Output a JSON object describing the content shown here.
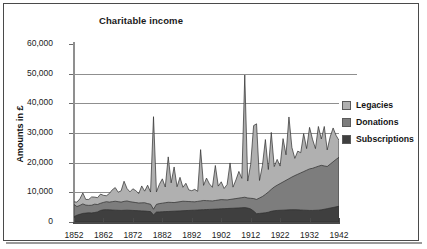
{
  "chart": {
    "title": "Charitable income",
    "ylabel": "Amounts in £"
  },
  "axes": {
    "y_ticks": [
      "0",
      "10,000",
      "20,000",
      "30,000",
      "40,000",
      "50,000",
      "60,000"
    ],
    "x_ticks": [
      "1852",
      "1862",
      "1872",
      "1882",
      "1892",
      "1902",
      "1912",
      "1922",
      "1932",
      "1942"
    ]
  },
  "legend": {
    "items": [
      {
        "label": "Legacies",
        "color": "#b0b0b0"
      },
      {
        "label": "Donations",
        "color": "#7d7d7d"
      },
      {
        "label": "Subscriptions",
        "color": "#3f3f3f"
      }
    ]
  },
  "chart_data": {
    "type": "area",
    "stacked": true,
    "title": "Charitable income",
    "xlabel": "",
    "ylabel": "Amounts in £",
    "xlim": [
      1852,
      1942
    ],
    "ylim": [
      0,
      60000
    ],
    "grid": true,
    "legend_position": "right",
    "x": [
      1852,
      1853,
      1854,
      1855,
      1856,
      1857,
      1858,
      1859,
      1860,
      1861,
      1862,
      1863,
      1864,
      1865,
      1866,
      1867,
      1868,
      1869,
      1870,
      1871,
      1872,
      1873,
      1874,
      1875,
      1876,
      1877,
      1878,
      1879,
      1880,
      1881,
      1882,
      1883,
      1884,
      1885,
      1886,
      1887,
      1888,
      1889,
      1890,
      1891,
      1892,
      1893,
      1894,
      1895,
      1896,
      1897,
      1898,
      1899,
      1900,
      1901,
      1902,
      1903,
      1904,
      1905,
      1906,
      1907,
      1908,
      1909,
      1910,
      1911,
      1912,
      1913,
      1914,
      1915,
      1916,
      1917,
      1918,
      1919,
      1920,
      1921,
      1922,
      1923,
      1924,
      1925,
      1926,
      1927,
      1928,
      1929,
      1930,
      1931,
      1932,
      1933,
      1934,
      1935,
      1936,
      1937,
      1938,
      1939,
      1940,
      1941,
      1942
    ],
    "series": [
      {
        "name": "Subscriptions",
        "color": "#3f3f3f",
        "values": [
          1800,
          2300,
          2600,
          2900,
          3000,
          3100,
          3050,
          3200,
          3400,
          3900,
          4100,
          4150,
          4100,
          4050,
          4000,
          3950,
          3900,
          3950,
          4000,
          3950,
          3900,
          3850,
          3800,
          3750,
          3700,
          3600,
          3500,
          2400,
          3350,
          3400,
          3450,
          3500,
          3550,
          3600,
          3650,
          3700,
          3750,
          3800,
          3850,
          3900,
          3950,
          4000,
          4050,
          4100,
          4150,
          4200,
          4250,
          4300,
          4350,
          4400,
          4450,
          4500,
          4550,
          4600,
          4650,
          4700,
          4750,
          4800,
          4850,
          4700,
          4400,
          3700,
          2800,
          2900,
          3000,
          3100,
          3300,
          3600,
          3800,
          3900,
          3950,
          4000,
          4050,
          4100,
          4150,
          4150,
          4100,
          4050,
          4000,
          3950,
          3900,
          3900,
          3950,
          4000,
          4100,
          4300,
          4500,
          4700,
          4900,
          5100,
          5300
        ]
      },
      {
        "name": "Donations",
        "color": "#7d7d7d",
        "values": [
          4100,
          2900,
          3000,
          3200,
          2700,
          2500,
          2600,
          2800,
          2500,
          2400,
          2500,
          2700,
          2600,
          2800,
          3000,
          2900,
          2800,
          3000,
          3100,
          2900,
          2800,
          2700,
          2600,
          2700,
          2800,
          2600,
          2500,
          1900,
          2600,
          2800,
          2900,
          3000,
          3100,
          3000,
          2900,
          3000,
          3100,
          3200,
          3100,
          3000,
          2900,
          2800,
          2900,
          3000,
          3100,
          3000,
          2900,
          2800,
          2900,
          3000,
          3100,
          3000,
          2900,
          3000,
          3100,
          3200,
          3300,
          3400,
          3500,
          3400,
          3600,
          4200,
          4800,
          5200,
          5600,
          6200,
          6800,
          7400,
          8000,
          8500,
          9000,
          9500,
          10000,
          10500,
          11000,
          11500,
          12000,
          12500,
          13000,
          13500,
          14000,
          14200,
          14500,
          14800,
          15000,
          14600,
          14200,
          14800,
          15400,
          16000,
          16500
        ]
      },
      {
        "name": "Legacies",
        "color": "#b0b0b0",
        "values": [
          900,
          1500,
          2200,
          3700,
          1900,
          2000,
          2800,
          2400,
          2300,
          3100,
          2400,
          2000,
          2900,
          4000,
          4600,
          3200,
          3800,
          6800,
          4200,
          3300,
          4500,
          4000,
          3200,
          5700,
          3900,
          6200,
          4100,
          31200,
          4200,
          6500,
          8200,
          5300,
          15300,
          6600,
          12000,
          5200,
          8200,
          4700,
          6100,
          3900,
          3700,
          4200,
          3400,
          17300,
          5100,
          7600,
          5700,
          4600,
          11800,
          4700,
          6000,
          3800,
          5200,
          12300,
          4000,
          6300,
          9000,
          6500,
          41200,
          5700,
          11400,
          24600,
          25500,
          5900,
          10500,
          18500,
          7600,
          19200,
          6900,
          8700,
          5900,
          14600,
          8600,
          20800,
          10000,
          5800,
          7800,
          6800,
          12800,
          7300,
          14000,
          9800,
          6300,
          13400,
          8900,
          13300,
          5600,
          9200,
          11400,
          8100,
          5700
        ]
      }
    ],
    "notes": [
      "Stacked area chart, bottom-to-top order: Subscriptions, Donations, Legacies",
      "Largest total peak approx 49,500 around 1910",
      "Secondary peak approx 35,500 around 1879"
    ]
  }
}
